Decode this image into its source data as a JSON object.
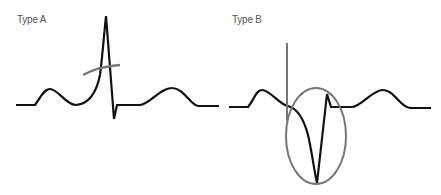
{
  "diagram": {
    "panels": [
      {
        "id": "type-a",
        "label": "Type A",
        "description": "ECG waveform with tall narrow R spike crossed by a gray oblique line"
      },
      {
        "id": "type-b",
        "label": "Type B",
        "description": "ECG waveform with deep negative deflection enclosed by a gray ellipse and marked by a gray vertical line"
      }
    ],
    "colors": {
      "trace": "#111111",
      "annotation": "#777777",
      "label": "#555555",
      "background": "#ffffff"
    }
  }
}
